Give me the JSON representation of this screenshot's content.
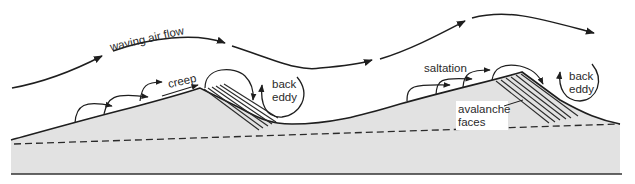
{
  "diagram": {
    "title_cut_off": "",
    "colors": {
      "background": "#ffffff",
      "sand_fill": "#e2e2e2",
      "line": "#1e1e1e",
      "text": "#2a2a2a"
    },
    "labels": {
      "air_flow": "waving air flow",
      "creep": "creep",
      "saltation": "saltation",
      "back_eddy_1_line1": "back",
      "back_eddy_1_line2": "eddy",
      "back_eddy_2_line1": "back",
      "back_eddy_2_line2": "eddy",
      "avalanche_line1": "avalanche",
      "avalanche_line2": "faces"
    },
    "elements": [
      "waving air flow arrows",
      "dune 1 with creep arrows and avalanche (slip) face",
      "dune 2 with saltation arrows and avalanche faces",
      "back eddy circulation on lee side of each dune",
      "dashed baseline within sand body",
      "solid ground base line"
    ]
  }
}
